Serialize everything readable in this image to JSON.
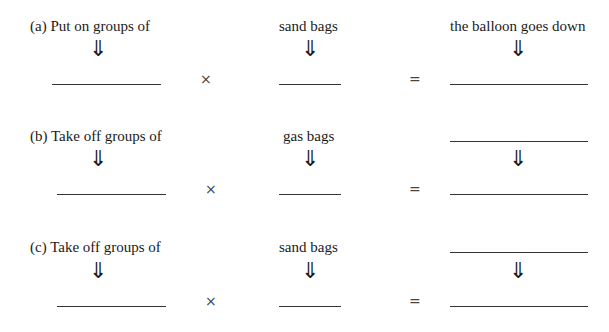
{
  "worksheet": {
    "rows": [
      {
        "id": "a",
        "prefix": "(a)",
        "groups_label": "Put on groups of",
        "bags_label": "sand bags",
        "result_label": "the balloon goes down",
        "result_is_blank": false,
        "times_symbol": "×",
        "equals_symbol": "=",
        "arrow_symbol": "⇓",
        "answers": {
          "groups": "",
          "bags": "",
          "result": ""
        }
      },
      {
        "id": "b",
        "prefix": "(b)",
        "groups_label": "Take off groups of",
        "bags_label": "gas bags",
        "result_label": "",
        "result_is_blank": true,
        "times_symbol": "×",
        "equals_symbol": "=",
        "arrow_symbol": "⇓",
        "answers": {
          "groups": "",
          "bags": "",
          "result_description": "",
          "result": ""
        }
      },
      {
        "id": "c",
        "prefix": "(c)",
        "groups_label": "Take off groups of",
        "bags_label": "sand bags",
        "result_label": "",
        "result_is_blank": true,
        "times_symbol": "×",
        "equals_symbol": "=",
        "arrow_symbol": "⇓",
        "answers": {
          "groups": "",
          "bags": "",
          "result_description": "",
          "result": ""
        }
      }
    ]
  }
}
